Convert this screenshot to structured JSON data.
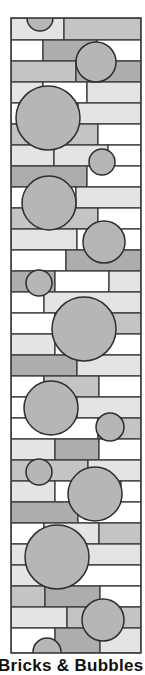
{
  "caption": "Bricks & Bubbles",
  "colors": {
    "outline": "#3a3a3a",
    "white": "#ffffff",
    "light": "#e4e4e4",
    "mid": "#c4c4c4",
    "dark": "#adadad",
    "bubble": "#b6b6b6"
  },
  "frame": {
    "x": 11,
    "y": 18,
    "width": 130,
    "height": 635
  },
  "rows": [
    {
      "y": 18,
      "h": 22,
      "bricks": [
        [
          11,
          64,
          "light"
        ],
        [
          64,
          141,
          "mid"
        ]
      ]
    },
    {
      "y": 40,
      "h": 21,
      "bricks": [
        [
          11,
          43,
          "white"
        ],
        [
          43,
          97,
          "dark"
        ],
        [
          97,
          141,
          "white"
        ]
      ]
    },
    {
      "y": 61,
      "h": 21,
      "bricks": [
        [
          11,
          76,
          "mid"
        ],
        [
          76,
          141,
          "dark"
        ]
      ]
    },
    {
      "y": 82,
      "h": 21,
      "bricks": [
        [
          11,
          43,
          "light"
        ],
        [
          43,
          87,
          "white"
        ],
        [
          87,
          141,
          "light"
        ]
      ]
    },
    {
      "y": 103,
      "h": 21,
      "bricks": [
        [
          11,
          78,
          "white"
        ],
        [
          78,
          141,
          "light"
        ]
      ]
    },
    {
      "y": 124,
      "h": 21,
      "bricks": [
        [
          11,
          98,
          "mid"
        ],
        [
          98,
          141,
          "white"
        ]
      ]
    },
    {
      "y": 145,
      "h": 21,
      "bricks": [
        [
          11,
          54,
          "light"
        ],
        [
          54,
          108,
          "light"
        ],
        [
          108,
          141,
          "white"
        ]
      ]
    },
    {
      "y": 166,
      "h": 21,
      "bricks": [
        [
          11,
          87,
          "dark"
        ],
        [
          87,
          141,
          "white"
        ]
      ]
    },
    {
      "y": 187,
      "h": 21,
      "bricks": [
        [
          11,
          76,
          "white"
        ],
        [
          76,
          141,
          "light"
        ]
      ]
    },
    {
      "y": 208,
      "h": 21,
      "bricks": [
        [
          11,
          98,
          "mid"
        ],
        [
          98,
          141,
          "white"
        ]
      ]
    },
    {
      "y": 229,
      "h": 21,
      "bricks": [
        [
          11,
          77,
          "light"
        ],
        [
          77,
          141,
          "white"
        ]
      ]
    },
    {
      "y": 250,
      "h": 21,
      "bricks": [
        [
          11,
          66,
          "white"
        ],
        [
          66,
          141,
          "dark"
        ]
      ]
    },
    {
      "y": 271,
      "h": 21,
      "bricks": [
        [
          11,
          55,
          "dark"
        ],
        [
          55,
          109,
          "white"
        ],
        [
          109,
          141,
          "light"
        ]
      ]
    },
    {
      "y": 292,
      "h": 21,
      "bricks": [
        [
          11,
          44,
          "white"
        ],
        [
          44,
          141,
          "light"
        ]
      ]
    },
    {
      "y": 313,
      "h": 21,
      "bricks": [
        [
          11,
          55,
          "white"
        ],
        [
          55,
          141,
          "mid"
        ]
      ]
    },
    {
      "y": 334,
      "h": 21,
      "bricks": [
        [
          11,
          55,
          "light"
        ],
        [
          55,
          141,
          "white"
        ]
      ]
    },
    {
      "y": 355,
      "h": 21,
      "bricks": [
        [
          11,
          77,
          "dark"
        ],
        [
          77,
          141,
          "light"
        ]
      ]
    },
    {
      "y": 376,
      "h": 21,
      "bricks": [
        [
          11,
          44,
          "white"
        ],
        [
          44,
          99,
          "mid"
        ],
        [
          99,
          141,
          "white"
        ]
      ]
    },
    {
      "y": 397,
      "h": 21,
      "bricks": [
        [
          11,
          77,
          "white"
        ],
        [
          77,
          141,
          "light"
        ]
      ]
    },
    {
      "y": 418,
      "h": 21,
      "bricks": [
        [
          11,
          98,
          "white"
        ],
        [
          98,
          141,
          "mid"
        ]
      ]
    },
    {
      "y": 439,
      "h": 21,
      "bricks": [
        [
          11,
          55,
          "light"
        ],
        [
          55,
          99,
          "dark"
        ],
        [
          99,
          141,
          "white"
        ]
      ]
    },
    {
      "y": 460,
      "h": 21,
      "bricks": [
        [
          11,
          88,
          "mid"
        ],
        [
          88,
          141,
          "light"
        ]
      ]
    },
    {
      "y": 481,
      "h": 21,
      "bricks": [
        [
          11,
          55,
          "light"
        ],
        [
          55,
          121,
          "white"
        ],
        [
          121,
          141,
          "white"
        ]
      ]
    },
    {
      "y": 502,
      "h": 21,
      "bricks": [
        [
          11,
          78,
          "dark"
        ],
        [
          78,
          141,
          "white"
        ]
      ]
    },
    {
      "y": 523,
      "h": 21,
      "bricks": [
        [
          11,
          44,
          "white"
        ],
        [
          44,
          99,
          "light"
        ],
        [
          99,
          141,
          "mid"
        ]
      ]
    },
    {
      "y": 544,
      "h": 21,
      "bricks": [
        [
          11,
          141,
          "light"
        ]
      ]
    },
    {
      "y": 565,
      "h": 21,
      "bricks": [
        [
          11,
          55,
          "light"
        ],
        [
          55,
          141,
          "white"
        ]
      ]
    },
    {
      "y": 586,
      "h": 21,
      "bricks": [
        [
          11,
          45,
          "mid"
        ],
        [
          45,
          100,
          "dark"
        ],
        [
          100,
          141,
          "white"
        ]
      ]
    },
    {
      "y": 607,
      "h": 21,
      "bricks": [
        [
          11,
          67,
          "light"
        ],
        [
          67,
          141,
          "mid"
        ]
      ]
    },
    {
      "y": 628,
      "h": 25,
      "bricks": [
        [
          11,
          55,
          "white"
        ],
        [
          55,
          100,
          "dark"
        ],
        [
          100,
          141,
          "light"
        ]
      ]
    }
  ],
  "bubbles": [
    {
      "cx": 40,
      "cy": 18,
      "r": 13
    },
    {
      "cx": 96,
      "cy": 62,
      "r": 20
    },
    {
      "cx": 48,
      "cy": 118,
      "r": 32
    },
    {
      "cx": 102,
      "cy": 162,
      "r": 13
    },
    {
      "cx": 49,
      "cy": 203,
      "r": 27
    },
    {
      "cx": 104,
      "cy": 242,
      "r": 21
    },
    {
      "cx": 39,
      "cy": 283,
      "r": 13
    },
    {
      "cx": 84,
      "cy": 329,
      "r": 32
    },
    {
      "cx": 51,
      "cy": 408,
      "r": 27
    },
    {
      "cx": 110,
      "cy": 427,
      "r": 14
    },
    {
      "cx": 39,
      "cy": 472,
      "r": 13
    },
    {
      "cx": 95,
      "cy": 494,
      "r": 27
    },
    {
      "cx": 57,
      "cy": 557,
      "r": 32
    },
    {
      "cx": 103,
      "cy": 620,
      "r": 21
    },
    {
      "cx": 47,
      "cy": 652,
      "r": 14
    }
  ]
}
